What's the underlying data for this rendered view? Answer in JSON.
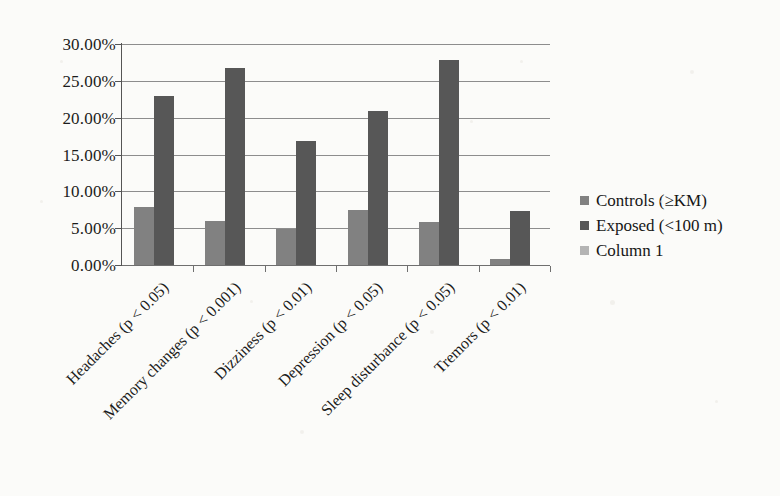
{
  "chart_data": {
    "type": "bar",
    "title": "",
    "xlabel": "",
    "ylabel": "",
    "ylim": [
      0,
      30
    ],
    "ytick_labels": [
      "0.00%",
      "5.00%",
      "10.00%",
      "15.00%",
      "20.00%",
      "25.00%",
      "30.00%"
    ],
    "ytick_values": [
      0,
      5,
      10,
      15,
      20,
      25,
      30
    ],
    "grid": true,
    "legend_position": "right",
    "categories": [
      "Headaches (p < 0.05)",
      "Memory changes (p < 0.001)",
      "Dizziness (p < 0.01)",
      "Depression (p < 0.05)",
      "Sleep disturbance (p < 0.05)",
      "Tremors (p < 0.01)"
    ],
    "series": [
      {
        "name": "Controls (≥KM)",
        "color": "#818181",
        "values": [
          7.9,
          6.0,
          4.9,
          7.5,
          5.9,
          0.8
        ]
      },
      {
        "name": "Exposed (<100 m)",
        "color": "#575757",
        "values": [
          23.0,
          26.8,
          16.9,
          20.9,
          27.8,
          7.3
        ]
      },
      {
        "name": "Column 1",
        "color": "#b4b4b4",
        "values": [
          0,
          0,
          0,
          0,
          0,
          0
        ]
      }
    ]
  },
  "legend": {
    "items": [
      {
        "label": "Controls (≥KM)",
        "color": "#818181"
      },
      {
        "label": "Exposed (<100 m)",
        "color": "#575757"
      },
      {
        "label": "Column 1",
        "color": "#b4b4b4"
      }
    ]
  }
}
